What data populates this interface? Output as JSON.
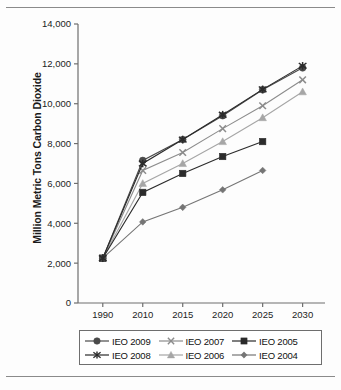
{
  "chart_data": {
    "type": "line",
    "title": "",
    "xlabel": "",
    "ylabel": "Million Metric Tons Carbon Dioxide",
    "categories": [
      "1990",
      "2010",
      "2015",
      "2020",
      "2025",
      "2030"
    ],
    "ylim": [
      0,
      14000
    ],
    "ytick_labels": [
      "0",
      "2,000",
      "4,000",
      "6,000",
      "8,000",
      "10,000",
      "12,000",
      "14,000"
    ],
    "yticks": [
      0,
      2000,
      4000,
      6000,
      8000,
      10000,
      12000,
      14000
    ],
    "grid": false,
    "legend_position": "bottom",
    "series": [
      {
        "name": "IEO 2009",
        "marker": "circle",
        "color": "#4a4a4a",
        "values": [
          2250,
          7150,
          8200,
          9400,
          10700,
          11800
        ]
      },
      {
        "name": "IEO 2008",
        "marker": "asterisk",
        "color": "#2b2b2b",
        "values": [
          2250,
          7000,
          8200,
          9450,
          10720,
          11900
        ]
      },
      {
        "name": "IEO 2007",
        "marker": "x",
        "color": "#8c8c8c",
        "values": [
          2250,
          6650,
          7550,
          8750,
          9900,
          11200
        ]
      },
      {
        "name": "IEO 2006",
        "marker": "triangle",
        "color": "#a6a6a6",
        "values": [
          2250,
          6000,
          7000,
          8100,
          9300,
          10600
        ]
      },
      {
        "name": "IEO 2005",
        "marker": "square",
        "color": "#2b2b2b",
        "values": [
          2250,
          5550,
          6500,
          7350,
          8100,
          null
        ]
      },
      {
        "name": "IEO 2004",
        "marker": "diamond",
        "color": "#757575",
        "values": [
          2250,
          4070,
          4800,
          5680,
          6650,
          null
        ]
      }
    ]
  },
  "legend": {
    "rows": [
      [
        {
          "label": "IEO 2009",
          "marker": "circle"
        },
        {
          "label": "IEO 2007",
          "marker": "x"
        },
        {
          "label": "IEO 2005",
          "marker": "square"
        }
      ],
      [
        {
          "label": "IEO 2008",
          "marker": "asterisk"
        },
        {
          "label": "IEO 2006",
          "marker": "triangle"
        },
        {
          "label": "IEO 2004",
          "marker": "diamond"
        }
      ]
    ]
  },
  "colors": {
    "axis": "#6e6e6e",
    "text": "#1c1c1c",
    "rule": "#8a8a8a"
  }
}
